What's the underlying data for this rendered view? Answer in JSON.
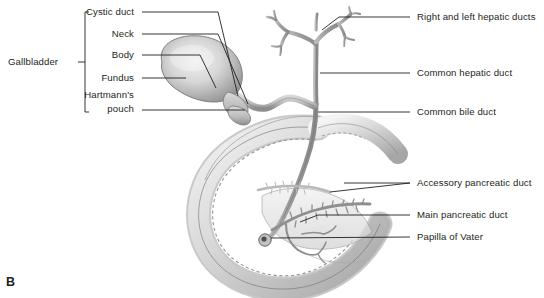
{
  "figure": {
    "panel_letter": "B",
    "title_implicit": "Anatomy of the gallbladder and biliary tree",
    "background_color": "#ffffff",
    "line_color": "#231f20",
    "text_color": "#231f20"
  },
  "left_group": {
    "group_label": "Gallbladder",
    "bracket": {
      "x": 85,
      "top": 12,
      "bottom": 112
    },
    "items": [
      {
        "label": "Cystic duct",
        "text_x": 138,
        "text_y": 12,
        "line_from_x": 142,
        "line_to_x": 218,
        "line_y": 12
      },
      {
        "label": "Neck",
        "text_x": 138,
        "text_y": 34,
        "line_from_x": 142,
        "line_to_x": 218,
        "line_y": 34
      },
      {
        "label": "Body",
        "text_x": 138,
        "text_y": 55,
        "line_from_x": 142,
        "line_to_x": 200,
        "line_y": 55
      },
      {
        "label": "Fundus",
        "text_x": 138,
        "text_y": 78,
        "line_from_x": 142,
        "line_to_x": 186,
        "line_y": 78
      },
      {
        "label": "Hartmann's",
        "text_x": 138,
        "text_y": 96,
        "line_from_x": 0,
        "line_to_x": 0,
        "line_y": 0
      },
      {
        "label": "pouch",
        "text_x": 138,
        "text_y": 110,
        "line_from_x": 142,
        "line_to_x": 245,
        "line_y": 110
      }
    ]
  },
  "right_group": {
    "items": [
      {
        "label": "Right and left hepatic ducts",
        "text_x": 417,
        "text_y": 17,
        "line_from_x": 339,
        "line_to_x": 410,
        "line_y": 17
      },
      {
        "label": "Common hepatic duct",
        "text_x": 417,
        "text_y": 73,
        "line_from_x": 320,
        "line_to_x": 410,
        "line_y": 73
      },
      {
        "label": "Common bile duct",
        "text_x": 417,
        "text_y": 112,
        "line_from_x": 318,
        "line_to_x": 410,
        "line_y": 112
      },
      {
        "label": "Accessory pancreatic duct",
        "text_x": 417,
        "text_y": 183,
        "line_from_x": 320,
        "line_to_x": 410,
        "line_y": 183
      },
      {
        "label": "Main pancreatic duct",
        "text_x": 417,
        "text_y": 215,
        "line_from_x": 318,
        "line_to_x": 410,
        "line_y": 215
      },
      {
        "label": "Papilla of Vater",
        "text_x": 417,
        "text_y": 237,
        "line_from_x": 268,
        "line_to_x": 410,
        "line_y": 237
      }
    ]
  },
  "anatomy": {
    "structures": [
      "gallbladder-fundus",
      "gallbladder-body",
      "gallbladder-neck",
      "hartmanns-pouch",
      "cystic-duct",
      "right-hepatic-duct",
      "left-hepatic-duct",
      "common-hepatic-duct",
      "common-bile-duct",
      "duodenum",
      "pancreas",
      "main-pancreatic-duct",
      "accessory-pancreatic-duct",
      "papilla-of-vater"
    ],
    "palette": {
      "duct_fill": "#a8a8a8",
      "duct_stroke": "#6e6e6e",
      "gallbladder_light": "#ececec",
      "gallbladder_mid": "#c4c4c4",
      "gallbladder_dark": "#8f8f8f",
      "duodenum_light": "#efefef",
      "duodenum_mid": "#cfcfcf",
      "duodenum_dark": "#9c9c9c",
      "pancreas_fill": "#e3e3e3",
      "papilla_fill": "#5a5a5a"
    }
  }
}
